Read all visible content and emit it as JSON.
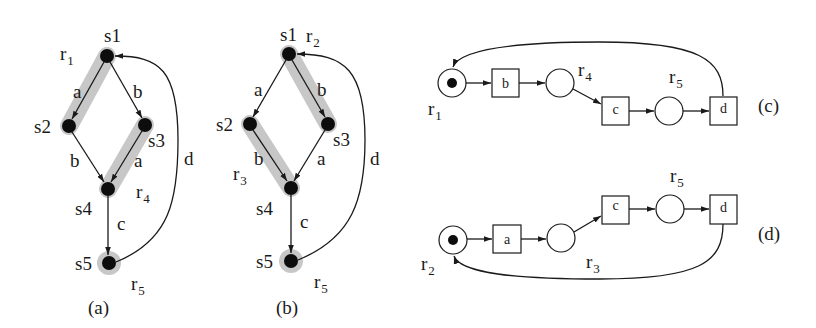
{
  "figure": {
    "panels": [
      {
        "id": "a",
        "caption": "(a)",
        "type": "transition-system",
        "states": [
          "s1",
          "s2",
          "s3",
          "s4",
          "s5"
        ],
        "edges": [
          {
            "from": "s1",
            "to": "s2",
            "label": "a"
          },
          {
            "from": "s1",
            "to": "s3",
            "label": "b"
          },
          {
            "from": "s2",
            "to": "s4",
            "label": "b"
          },
          {
            "from": "s3",
            "to": "s4",
            "label": "a"
          },
          {
            "from": "s4",
            "to": "s5",
            "label": "c"
          },
          {
            "from": "s5",
            "to": "s1",
            "label": "d"
          }
        ],
        "regions": [
          {
            "name": "r",
            "sub": "1",
            "highlight": "s1-s2"
          },
          {
            "name": "r",
            "sub": "4",
            "highlight": "s3-s4"
          },
          {
            "name": "r",
            "sub": "5",
            "highlight": "s5"
          }
        ]
      },
      {
        "id": "b",
        "caption": "(b)",
        "type": "transition-system",
        "states": [
          "s1",
          "s2",
          "s3",
          "s4",
          "s5"
        ],
        "edges": [
          {
            "from": "s1",
            "to": "s2",
            "label": "a"
          },
          {
            "from": "s1",
            "to": "s3",
            "label": "b"
          },
          {
            "from": "s2",
            "to": "s4",
            "label": "b"
          },
          {
            "from": "s3",
            "to": "s4",
            "label": "a"
          },
          {
            "from": "s4",
            "to": "s5",
            "label": "c"
          },
          {
            "from": "s5",
            "to": "s1",
            "label": "d"
          }
        ],
        "regions": [
          {
            "name": "r",
            "sub": "2",
            "highlight": "s1-s3"
          },
          {
            "name": "r",
            "sub": "3",
            "highlight": "s2-s4"
          },
          {
            "name": "r",
            "sub": "5",
            "highlight": "s5"
          }
        ]
      },
      {
        "id": "c",
        "caption": "(c)",
        "type": "petri-net",
        "places": [
          {
            "name": "r",
            "sub": "1",
            "token": true
          },
          {
            "name": "r",
            "sub": "4",
            "token": false
          },
          {
            "name": "r",
            "sub": "5",
            "token": false
          }
        ],
        "transitions": [
          "b",
          "c",
          "d"
        ],
        "flow": "r1 -> b -> r4 -> c -> r5 -> d -> r1"
      },
      {
        "id": "d",
        "caption": "(d)",
        "type": "petri-net",
        "places": [
          {
            "name": "r",
            "sub": "2",
            "token": true
          },
          {
            "name": "r",
            "sub": "3",
            "token": false
          },
          {
            "name": "r",
            "sub": "5",
            "token": false
          }
        ],
        "transitions": [
          "a",
          "c",
          "d"
        ],
        "flow": "r2 -> a -> r3 -> c -> r5 -> d -> r2"
      }
    ]
  },
  "labels": {
    "s1": "s1",
    "s2": "s2",
    "s3": "s3",
    "s4": "s4",
    "s5": "s5",
    "a": "a",
    "b": "b",
    "c": "c",
    "d": "d",
    "r": "r",
    "sub1": "1",
    "sub2": "2",
    "sub3": "3",
    "sub4": "4",
    "sub5": "5"
  },
  "colors": {
    "ink": "#1a1a1a",
    "highlight": "#bdbdbd",
    "background": "#ffffff"
  }
}
